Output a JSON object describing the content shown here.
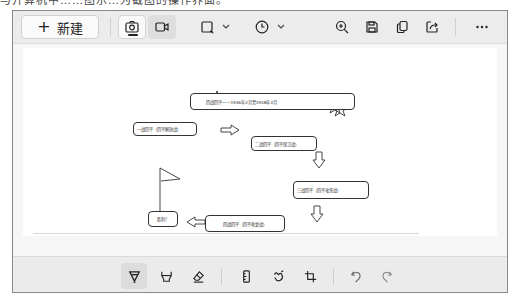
{
  "top_text": "与开算机中……图示…为截图的操作界面。",
  "toolbar": {
    "new_button": {
      "icon": "plus-icon",
      "label": "新建"
    },
    "items": [
      {
        "name": "screenshot-mode-button",
        "icon": "camera-icon",
        "active": true
      },
      {
        "name": "video-mode-button",
        "icon": "video-camera-icon",
        "active": false
      },
      {
        "name": "capture-shape-button",
        "icon": "rectangle-select-icon",
        "dropdown": true
      },
      {
        "name": "delay-button",
        "icon": "clock-icon",
        "dropdown": true
      },
      {
        "name": "zoom-in-button",
        "icon": "zoom-in-icon"
      },
      {
        "name": "save-button",
        "icon": "floppy-disk-icon"
      },
      {
        "name": "copy-button",
        "icon": "copy-icon"
      },
      {
        "name": "share-button",
        "icon": "share-icon"
      },
      {
        "name": "more-button",
        "icon": "more-horizontal-icon"
      }
    ]
  },
  "diagram": {
    "title_box": "四战四平——1946年3月至1948年3月",
    "boxes": [
      {
        "id": "battle1",
        "label": "一战四平（四平解放战）"
      },
      {
        "id": "battle2",
        "label": "二战四平（四平保卫战）"
      },
      {
        "id": "battle3",
        "label": "三战四平（四平攻坚战）"
      },
      {
        "id": "battle4",
        "label": "四战四平（四平收复战）"
      },
      {
        "id": "victory",
        "label": "胜利！"
      }
    ]
  },
  "bottom_toolbar": {
    "items": [
      {
        "name": "ballpoint-pen-tool",
        "icon": "pen-icon",
        "selected": true
      },
      {
        "name": "highlighter-tool",
        "icon": "highlighter-icon"
      },
      {
        "name": "eraser-tool",
        "icon": "eraser-icon"
      },
      {
        "name": "ruler-tool",
        "icon": "ruler-icon"
      },
      {
        "name": "touch-writing-tool",
        "icon": "touch-writing-icon"
      },
      {
        "name": "crop-tool",
        "icon": "crop-icon"
      },
      {
        "name": "undo-button",
        "icon": "undo-icon"
      },
      {
        "name": "redo-button",
        "icon": "redo-icon"
      }
    ]
  }
}
